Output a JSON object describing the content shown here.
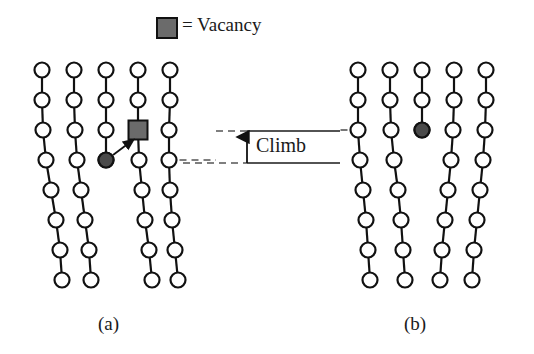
{
  "figure": {
    "title_text": "",
    "width": 534,
    "height": 354,
    "background": "#ffffff"
  },
  "legend": {
    "symbol": "filled-gray-square",
    "symbol_fill": "#6b6b6b",
    "symbol_stroke": "#111111",
    "text": "= Vacancy"
  },
  "climb_annotation": {
    "label": "Climb",
    "arrow_direction": "up",
    "upper_line_y": 131,
    "lower_line_y": 163,
    "dashed_color": "#555555",
    "solid_color": "#1a1a1a"
  },
  "panels": [
    {
      "id": "a",
      "label": "(a)",
      "description": "Edge dislocation with vacancy adjacent to the extra half-plane terminus",
      "atom_fill": "#ffffff",
      "atom_stroke": "#111111",
      "dislocation_atom_fill": "#4a4a4a",
      "vacancy_fill": "#6b6b6b",
      "vacancy_position": {
        "col": 4,
        "row": 3
      },
      "dislocation_atom_position": {
        "col": 3,
        "row": 4
      },
      "arrow": {
        "from": "dislocation-atom",
        "to": "vacancy"
      }
    },
    {
      "id": "b",
      "label": "(b)",
      "description": "After climb: the dislocation line has moved up one lattice spacing",
      "atom_fill": "#ffffff",
      "atom_stroke": "#111111",
      "dislocation_atom_fill": "#4a4a4a",
      "dislocation_atom_position": {
        "col": 3,
        "row": 3
      }
    }
  ],
  "lattice": {
    "columns": 5,
    "rows_per_column": 8,
    "atom_radius": 7.5,
    "row_spacing": 30,
    "column_spacing": 32
  },
  "colors": {
    "line": "#111111",
    "atom_open": "#ffffff",
    "atom_filled": "#4a4a4a",
    "vacancy": "#6b6b6b",
    "text": "#1a1a1a",
    "dashed": "#555555"
  }
}
